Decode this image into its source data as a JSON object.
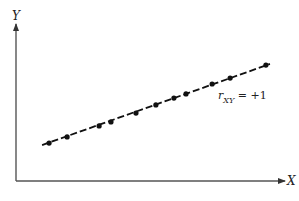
{
  "chart_data": {
    "type": "scatter",
    "title": "",
    "xlabel": "X",
    "ylabel": "Y",
    "xlim": [
      0,
      100
    ],
    "ylim": [
      0,
      100
    ],
    "grid": false,
    "legend": "none",
    "series": [
      {
        "name": "points",
        "x": [
          12.3,
          19.0,
          30.9,
          35.3,
          44.6,
          52.0,
          58.7,
          63.2,
          72.9,
          79.6,
          92.9
        ],
        "y": [
          24.8,
          28.8,
          36.0,
          38.6,
          44.4,
          49.7,
          54.2,
          56.9,
          63.4,
          67.3,
          75.8
        ]
      }
    ],
    "fit_line": {
      "style": "dashed",
      "x": [
        9.7,
        94.4
      ],
      "y": [
        23.5,
        76.5
      ]
    },
    "annotations": [
      {
        "text_main": "r",
        "text_sub": "XY",
        "text_rest": " = +1"
      }
    ]
  }
}
